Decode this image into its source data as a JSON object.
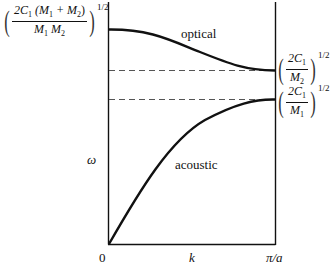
{
  "diagram": {
    "axis": {
      "y_label": "ω",
      "x_label": "k",
      "x_origin": "0",
      "x_end": "π/a"
    },
    "branches": {
      "optical": "optical",
      "acoustic": "acoustic"
    },
    "levels": {
      "top": {
        "prefix": "2C",
        "sub1": "1",
        "paren_open": "(M",
        "sub2": "1",
        "plus": " + M",
        "sub3": "2",
        "paren_close": ")",
        "den_a": "M",
        "den_a_sub": "1",
        "den_b": " M",
        "den_b_sub": "2",
        "exp": "1/2"
      },
      "upper_gap": {
        "num": "2C",
        "num_sub": "1",
        "den": "M",
        "den_sub": "2",
        "exp": "1/2"
      },
      "lower_gap": {
        "num": "2C",
        "num_sub": "1",
        "den": "M",
        "den_sub": "1",
        "exp": "1/2"
      }
    },
    "colors": {
      "line": "#111111",
      "dash": "#555555"
    }
  }
}
